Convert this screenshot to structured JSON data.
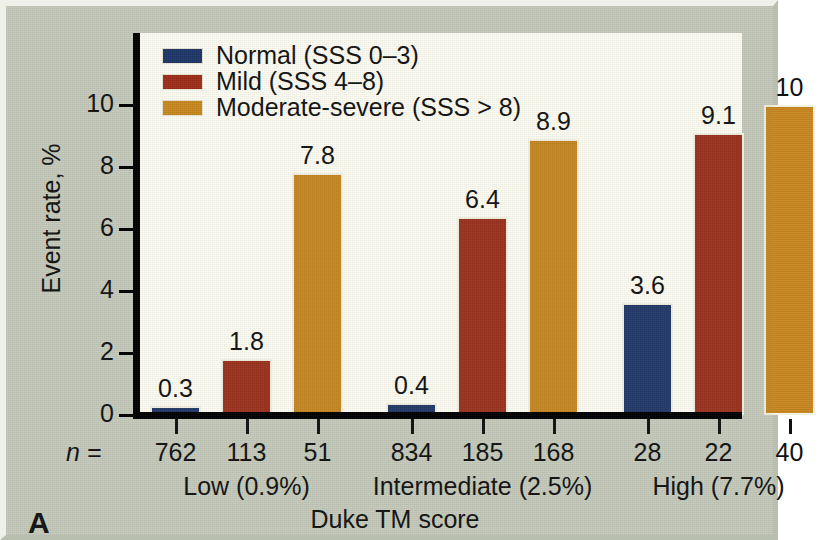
{
  "figure": {
    "panel_label": "A",
    "background_color": "#c4c9ba",
    "plot_background_color": "#fdfcf2"
  },
  "chart_data": {
    "type": "bar",
    "title": "",
    "xlabel": "Duke TM score",
    "ylabel": "Event rate, %",
    "ylim": [
      0,
      10.6
    ],
    "yticks": [
      "0",
      "2",
      "4",
      "6",
      "8",
      "10"
    ],
    "ytick_values": [
      0,
      2,
      4,
      6,
      8,
      10
    ],
    "grid": false,
    "legend_position": "top-left",
    "categories": [
      "Low (0.9%)",
      "Intermediate (2.5%)",
      "High (7.7%)"
    ],
    "series": [
      {
        "name": "Normal (SSS 0–3)",
        "color": "#1d3568",
        "values": [
          0.3,
          0.4,
          3.6
        ],
        "value_labels": [
          "0.3",
          "0.4",
          "3.6"
        ],
        "n": [
          762,
          834,
          28
        ]
      },
      {
        "name": "Mild (SSS 4–8)",
        "color": "#9c2d18",
        "values": [
          1.8,
          6.4,
          9.1
        ],
        "value_labels": [
          "1.8",
          "6.4",
          "9.1"
        ],
        "n": [
          113,
          185,
          22
        ]
      },
      {
        "name": "Moderate-severe (SSS > 8)",
        "color": "#c8871e",
        "values": [
          7.8,
          8.9,
          10.0
        ],
        "value_labels": [
          "7.8",
          "8.9",
          "10"
        ],
        "n": [
          51,
          168,
          40
        ]
      }
    ],
    "n_row_label": "n ="
  },
  "axis": {
    "ytick_0": "0",
    "ytick_1": "2",
    "ytick_2": "4",
    "ytick_3": "6",
    "ytick_4": "8",
    "ytick_5": "10"
  },
  "legend": {
    "items": [
      {
        "label": "Normal (SSS 0–3)",
        "color": "#1d3568"
      },
      {
        "label": "Mild (SSS 4–8)",
        "color": "#9c2d18"
      },
      {
        "label": "Moderate-severe (SSS > 8)",
        "color": "#c8871e"
      }
    ]
  },
  "n_values": [
    "762",
    "113",
    "51",
    "834",
    "185",
    "168",
    "28",
    "22",
    "40"
  ],
  "bar_values": [
    "0.3",
    "1.8",
    "7.8",
    "0.4",
    "6.4",
    "8.9",
    "3.6",
    "9.1",
    "10"
  ],
  "group_labels": [
    "Low (0.9%)",
    "Intermediate (2.5%)",
    "High (7.7%)"
  ]
}
